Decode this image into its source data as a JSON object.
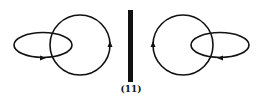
{
  "figure": {
    "label": "(11)",
    "stroke_color": "#111111",
    "left_diagram": {
      "ellipse": {
        "cx": 43,
        "cy": 45,
        "rx": 29,
        "ry": 12.5,
        "arrow": "bottom-pointing-right"
      },
      "circle": {
        "cx": 80,
        "cy": 45,
        "r": 30,
        "arrow": "right-side-pointing-up"
      }
    },
    "divider": {
      "x": 128,
      "y": 10,
      "width": 5,
      "height": 72
    },
    "right_diagram": {
      "circle": {
        "cx": 183,
        "cy": 45,
        "r": 30,
        "arrow": "left-side-pointing-up"
      },
      "ellipse": {
        "cx": 220,
        "cy": 45,
        "rx": 29,
        "ry": 12.5,
        "arrow": "bottom-pointing-left"
      }
    }
  }
}
